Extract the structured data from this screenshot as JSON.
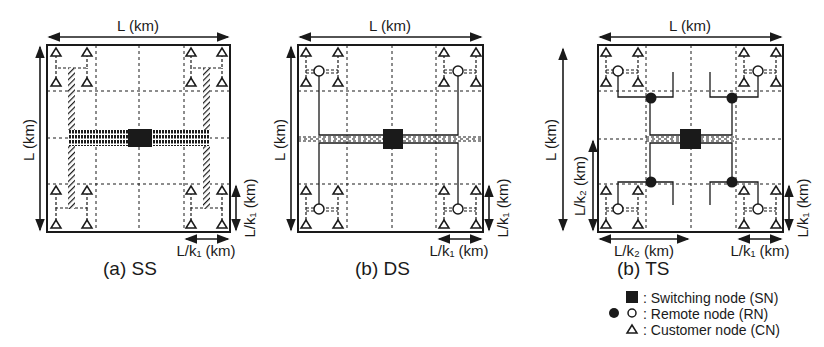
{
  "colors": {
    "ink": "#1a1a1a",
    "background": "#ffffff"
  },
  "panels": [
    {
      "id": "ss",
      "caption": "(a)  SS",
      "top_label": "L (km)",
      "left_label": "L (km)",
      "right_label": "L/k₁ (km)",
      "bottom_right_label": "L/k₁ (km)",
      "box": {
        "x": 47,
        "y": 45,
        "w": 183,
        "h": 187
      }
    },
    {
      "id": "ds",
      "caption": "(b)  DS",
      "top_label": "L (km)",
      "left_label": "L (km)",
      "right_label": "L/k₁ (km)",
      "bottom_right_label": "L/k₁ (km)",
      "box": {
        "x": 298,
        "y": 45,
        "w": 185,
        "h": 187
      }
    },
    {
      "id": "ts",
      "caption": "(b)  TS",
      "top_label": "L (km)",
      "left_label": "L (km)",
      "left_inner_label": "L/k₂ (km)",
      "right_label": "L/k₁ (km)",
      "bottom_left_label": "L/k₂ (km)",
      "bottom_right_label": "L/k₁ (km)",
      "box": {
        "x": 598,
        "y": 45,
        "w": 185,
        "h": 187
      }
    }
  ],
  "legend": {
    "items": [
      {
        "symbol": "filled-square",
        "label": ": Switching node (SN)"
      },
      {
        "symbol": "filled-and-open-circle",
        "label": ": Remote node (RN)"
      },
      {
        "symbol": "open-triangle",
        "label": ": Customer node (CN)"
      }
    ]
  }
}
